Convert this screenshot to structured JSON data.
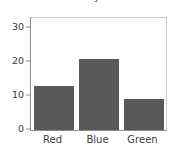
{
  "chart_data": {
    "type": "bar",
    "title": "Counts by Color",
    "xlabel": "",
    "ylabel": "",
    "categories": [
      "Red",
      "Blue",
      "Green"
    ],
    "values": [
      13,
      21,
      9
    ],
    "yticks": [
      0,
      10,
      20,
      30
    ],
    "ytick_labels": [
      "0",
      "10",
      "20",
      "30"
    ],
    "ylim": [
      0,
      33
    ],
    "grid": false,
    "legend": false,
    "legend_position": "none",
    "bar_color": "#595959",
    "axis_color": "#8c8c8c",
    "frame_color": "#c8c8c8",
    "text_color": "#3a3a3a",
    "background": "#ffffff",
    "title_clipped": true
  }
}
